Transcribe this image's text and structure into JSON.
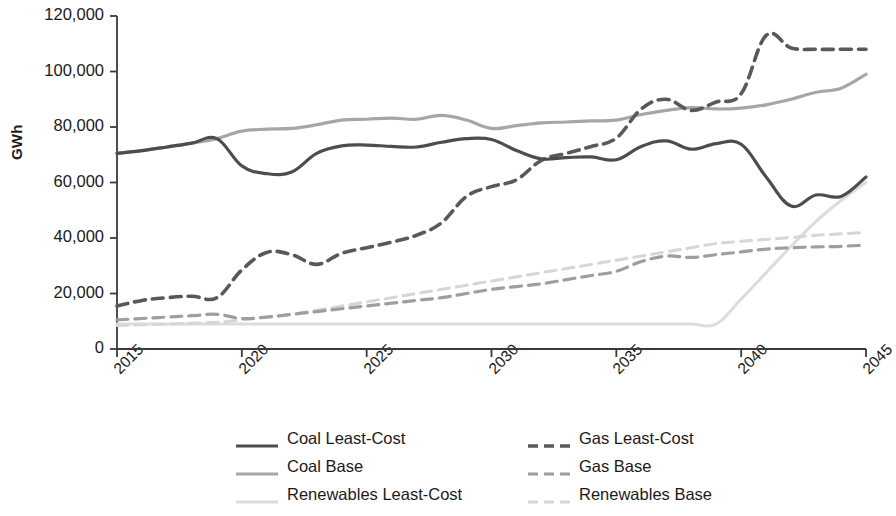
{
  "chart_data": {
    "type": "line",
    "title": "",
    "xlabel": "",
    "ylabel": "GWh",
    "xlim": [
      2015,
      2045
    ],
    "ylim": [
      0,
      120000
    ],
    "grid": false,
    "legend_position": "bottom",
    "x_ticks": [
      "2015",
      "2020",
      "2025",
      "2030",
      "2035",
      "2040",
      "2045"
    ],
    "x_tick_values": [
      2015,
      2020,
      2025,
      2030,
      2035,
      2040,
      2045
    ],
    "y_ticks": [
      "0",
      "20,000",
      "40,000",
      "60,000",
      "80,000",
      "100,000",
      "120,000"
    ],
    "y_tick_values": [
      0,
      20000,
      40000,
      60000,
      80000,
      100000,
      120000
    ],
    "x": [
      2015,
      2016,
      2017,
      2018,
      2019,
      2020,
      2021,
      2022,
      2023,
      2024,
      2025,
      2026,
      2027,
      2028,
      2029,
      2030,
      2031,
      2032,
      2033,
      2034,
      2035,
      2036,
      2037,
      2038,
      2039,
      2040,
      2041,
      2042,
      2043,
      2044,
      2045
    ],
    "series": [
      {
        "name": "Coal Least-Cost",
        "color": "#4d4d4d",
        "dash": "solid",
        "width": 3.2,
        "values": [
          70500,
          71500,
          72800,
          74200,
          75800,
          66000,
          63200,
          63800,
          70500,
          73200,
          73500,
          73000,
          72800,
          74500,
          75800,
          75500,
          71500,
          68500,
          69000,
          69200,
          68200,
          73000,
          75000,
          72000,
          74000,
          73800,
          62000,
          51500,
          55500,
          55000,
          62000
        ]
      },
      {
        "name": "Coal Base",
        "color": "#a6a6a6",
        "dash": "solid",
        "width": 3.2,
        "values": [
          70500,
          71500,
          72800,
          74200,
          75800,
          78500,
          79200,
          79500,
          80800,
          82500,
          82800,
          83200,
          82800,
          84200,
          82500,
          79500,
          80500,
          81500,
          81800,
          82200,
          82500,
          84500,
          86000,
          87000,
          86500,
          86800,
          88000,
          90000,
          92500,
          94000,
          99000
        ]
      },
      {
        "name": "Renewables Least-Cost",
        "color": "#dcdcdc",
        "dash": "solid",
        "width": 3.0,
        "values": [
          9000,
          9000,
          9000,
          9000,
          9000,
          9000,
          9000,
          9000,
          9000,
          9000,
          9000,
          9000,
          9000,
          9000,
          9000,
          9000,
          9000,
          9000,
          9000,
          9000,
          9000,
          9000,
          9000,
          9000,
          9000,
          18000,
          27500,
          37000,
          46000,
          53500,
          60000
        ]
      },
      {
        "name": "Gas Least-Cost",
        "color": "#595959",
        "dash": "dashed",
        "width": 3.6,
        "values": [
          15500,
          17500,
          18500,
          19000,
          18500,
          28500,
          34800,
          34000,
          30500,
          34500,
          36500,
          38500,
          41000,
          45500,
          55000,
          58500,
          61000,
          68000,
          70500,
          73000,
          76000,
          86500,
          90000,
          86000,
          89000,
          92000,
          113000,
          108500,
          108000,
          108000,
          108000
        ]
      },
      {
        "name": "Gas Base",
        "color": "#9e9e9e",
        "dash": "dashed",
        "width": 3.2,
        "values": [
          10500,
          11000,
          11500,
          12000,
          12500,
          11000,
          11500,
          12500,
          13500,
          14500,
          15500,
          16500,
          17500,
          18500,
          20000,
          21500,
          22500,
          23500,
          25000,
          26500,
          28000,
          31500,
          33500,
          33000,
          34000,
          35000,
          36000,
          36500,
          36800,
          37000,
          37500
        ]
      },
      {
        "name": "Renewables Base",
        "color": "#d6d6d6",
        "dash": "dashed",
        "width": 3.0,
        "values": [
          8500,
          8700,
          9000,
          9300,
          9600,
          10500,
          11500,
          12500,
          14000,
          15500,
          17000,
          18500,
          20000,
          21500,
          23000,
          24500,
          26000,
          27500,
          29000,
          30500,
          32000,
          33500,
          35000,
          36500,
          38000,
          38800,
          39500,
          40200,
          41000,
          41500,
          42000
        ]
      }
    ]
  },
  "legend": {
    "items": [
      {
        "label": "Coal Least-Cost"
      },
      {
        "label": "Gas Least-Cost"
      },
      {
        "label": "Coal Base"
      },
      {
        "label": "Gas Base"
      },
      {
        "label": "Renewables Least-Cost"
      },
      {
        "label": "Renewables Base"
      }
    ]
  },
  "axis": {
    "axis_color": "#3a3a3a"
  }
}
